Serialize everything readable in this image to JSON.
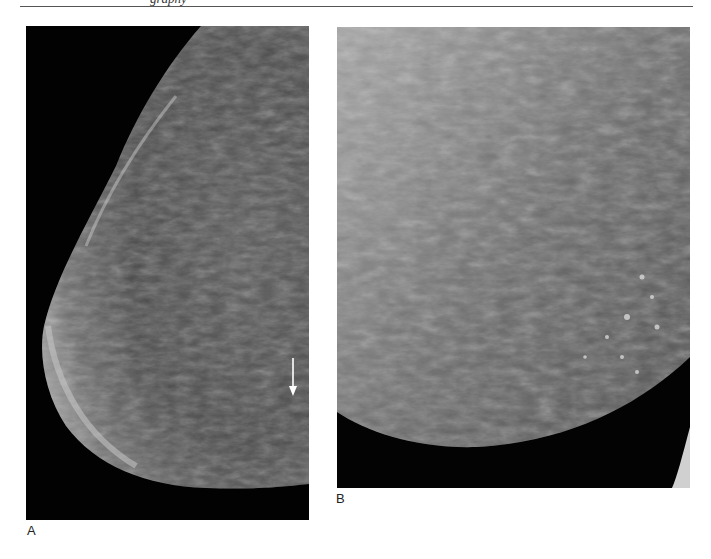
{
  "page": {
    "running_header": "graphy",
    "figures": [
      {
        "label": "A",
        "description": "Mediolateral mammogram of breast with arrow indicating calcifications",
        "annotations": [
          {
            "type": "arrow",
            "direction": "down",
            "color": "#ffffff"
          }
        ]
      },
      {
        "label": "B",
        "description": "Magnified mammogram view showing scattered calcifications",
        "annotations": []
      }
    ]
  }
}
